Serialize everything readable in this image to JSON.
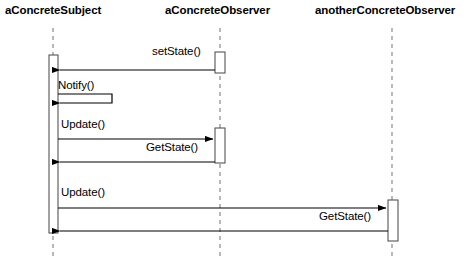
{
  "diagram": {
    "type": "uml-sequence-diagram",
    "title": "",
    "background_color": "#ffffff",
    "line_color": "#000000",
    "activation_fill": "#ffffff",
    "lifeline_dash_color": "#999999",
    "lifelines": [
      {
        "id": "subject",
        "label": "aConcreteSubject",
        "x": 53,
        "label_x": 5,
        "label_y": 10
      },
      {
        "id": "observer1",
        "label": "aConcreteObserver",
        "x": 220,
        "label_x": 165,
        "label_y": 10
      },
      {
        "id": "observer2",
        "label": "anotherConcreteObserver",
        "x": 392,
        "label_x": 315,
        "label_y": 10
      }
    ],
    "lifeline_top": 28,
    "lifeline_bottom": 258,
    "activations": [
      {
        "id": "act-subject",
        "lifeline": "subject",
        "x": 49,
        "y": 55,
        "width": 9,
        "height": 178
      },
      {
        "id": "act-observer1-a",
        "lifeline": "observer1",
        "x": 215,
        "y": 52,
        "width": 10,
        "height": 21
      },
      {
        "id": "act-observer1-b",
        "lifeline": "observer1",
        "x": 215,
        "y": 128,
        "width": 10,
        "height": 35
      },
      {
        "id": "act-observer2",
        "lifeline": "observer2",
        "x": 388,
        "y": 200,
        "width": 10,
        "height": 41
      }
    ],
    "messages": [
      {
        "id": "msg-setstate",
        "label": "setState()",
        "kind": "call",
        "direction": "left",
        "from_x": 215,
        "to_x": 59,
        "y": 70,
        "label_x": 152,
        "label_y": 50
      },
      {
        "id": "msg-notify",
        "label": "Notify()",
        "kind": "self",
        "direction": "left",
        "from_x": 58,
        "to_x": 59,
        "y": 103,
        "loop_x": 112,
        "loop_top": 94,
        "label_x": 58,
        "label_y": 83
      },
      {
        "id": "msg-update-1",
        "label": "Update()",
        "kind": "call",
        "direction": "right",
        "from_x": 58,
        "to_x": 214,
        "y": 139,
        "label_x": 61,
        "label_y": 122
      },
      {
        "id": "msg-getstate-1",
        "label": "GetState()",
        "kind": "return",
        "direction": "left",
        "from_x": 215,
        "to_x": 59,
        "y": 162,
        "label_x": 146,
        "label_y": 145
      },
      {
        "id": "msg-update-2",
        "label": "Update()",
        "kind": "call",
        "direction": "right",
        "from_x": 58,
        "to_x": 387,
        "y": 208,
        "label_x": 61,
        "label_y": 190
      },
      {
        "id": "msg-getstate-2",
        "label": "GetState()",
        "kind": "return",
        "direction": "left",
        "from_x": 388,
        "to_x": 59,
        "y": 231,
        "label_x": 319,
        "label_y": 212
      }
    ]
  }
}
